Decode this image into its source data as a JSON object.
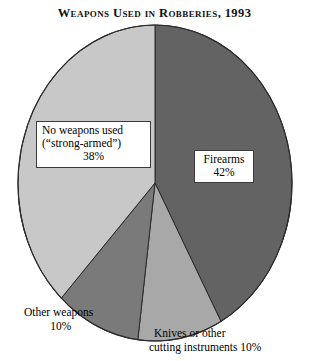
{
  "chart_data": {
    "type": "pie",
    "title": "Weapons Used in Robberies, 1993",
    "xlabel": "",
    "ylabel": "",
    "legend_position": "none",
    "grid": false,
    "start_angle_deg": 0,
    "direction": "clockwise",
    "categories": [
      "Firearms",
      "Knives or other cutting instruments",
      "Other weapons",
      "No weapons used (\"strong-armed\")"
    ],
    "values": [
      42,
      10,
      10,
      38
    ],
    "units": "percent",
    "colors": [
      "#636363",
      "#a8a8a8",
      "#7a7a7a",
      "#c8c8c8"
    ],
    "slices": [
      {
        "name": "Firearms",
        "value": 42,
        "color": "#636363",
        "label_line1": "Firearms",
        "label_line2": "42%",
        "label_placement": "inside"
      },
      {
        "name": "Knives or other cutting instruments",
        "value": 10,
        "color": "#a8a8a8",
        "label_line1": "Knives or other",
        "label_line2": "cutting instruments 10%",
        "label_placement": "outside-bottom-right"
      },
      {
        "name": "Other weapons",
        "value": 10,
        "color": "#7a7a7a",
        "label_line1": "Other weapons",
        "label_line2": "10%",
        "label_placement": "outside-bottom-left"
      },
      {
        "name": "No weapons used (\"strong-armed\")",
        "value": 38,
        "color": "#c8c8c8",
        "label_line1": "No weapons used",
        "label_line2": "(\"strong-armed\")",
        "label_line3": "38%",
        "label_placement": "inside"
      }
    ]
  },
  "title": {
    "text": "Weapons Used in Robberies, 1993"
  },
  "labels": {
    "no_weapons": {
      "line1": "No weapons used",
      "line2": "(“strong-armed”)",
      "line3": "38%"
    },
    "firearms": {
      "line1": "Firearms",
      "line2": "42%"
    },
    "other_weapons": {
      "line1": "Other weapons",
      "line2": "10%"
    },
    "knives": {
      "line1": "Knives or other",
      "line2": "cutting instruments 10%"
    }
  },
  "colors": {
    "firearms": "#636363",
    "knives": "#a8a8a8",
    "other_weapons": "#7a7a7a",
    "no_weapons": "#c8c8c8",
    "depth_shadow": "#0b0b0b",
    "outline": "#2b2b2b",
    "background": "#ffffff"
  }
}
